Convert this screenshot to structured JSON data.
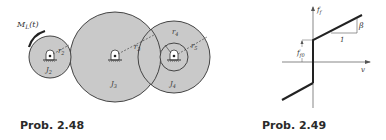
{
  "figures": [
    {
      "caption": "Prob. 2.48",
      "type": "gear-train",
      "labels": {
        "torque": "M_L(t)",
        "gear2_inertia": "J_2",
        "gear3_inertia": "J_3",
        "gear4_inertia": "J_4",
        "r2": "r_2",
        "r3": "r_3",
        "r4": "r_4",
        "r5": "r_5"
      },
      "colors": {
        "gear_fill": "#c8c8c8",
        "stroke": "#333333"
      }
    },
    {
      "caption": "Prob. 2.49",
      "type": "friction-characteristic",
      "labels": {
        "y_axis": "f_f",
        "x_axis": "v",
        "offset": "f_f0",
        "slope": "β",
        "unit_run": "1"
      }
    }
  ]
}
